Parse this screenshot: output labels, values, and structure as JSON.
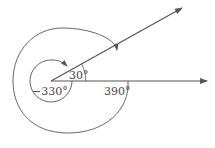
{
  "diagram": {
    "colors": {
      "line": "#555555",
      "text": "#444444"
    },
    "labels": {
      "angle_small": "30°",
      "angle_negative": "−330°",
      "angle_large": "390°"
    }
  }
}
